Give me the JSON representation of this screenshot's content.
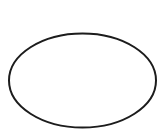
{
  "diagram": {
    "shape": "ellipse",
    "label": "",
    "stroke_color": "#1c1c1c",
    "fill_color": "#ffffff",
    "background": "#ffffff"
  }
}
